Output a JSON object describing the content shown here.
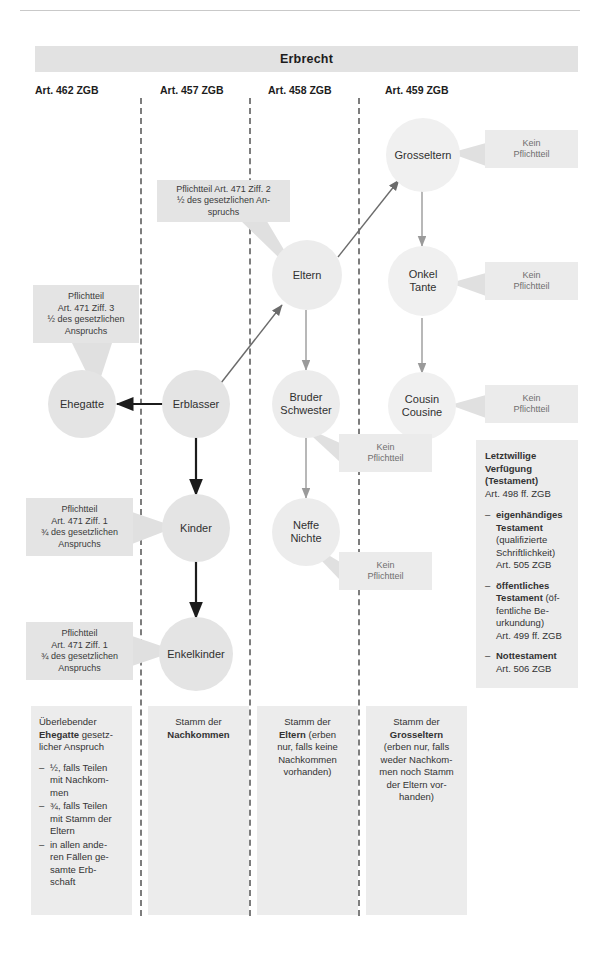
{
  "header": {
    "title": "Erbrecht"
  },
  "columns": [
    {
      "id": "col-462",
      "label": "Art. 462 ZGB"
    },
    {
      "id": "col-457",
      "label": "Art. 457 ZGB"
    },
    {
      "id": "col-458",
      "label": "Art. 458 ZGB"
    },
    {
      "id": "col-459",
      "label": "Art. 459 ZGB"
    }
  ],
  "nodes": {
    "grosseltern": "Grosseltern",
    "eltern": "Eltern",
    "onkel_tante": "Onkel\nTante",
    "onkel_tante_l1": "Onkel",
    "onkel_tante_l2": "Tante",
    "ehegatte": "Ehegatte",
    "erblasser": "Erblasser",
    "bruder_schwester_l1": "Bruder",
    "bruder_schwester_l2": "Schwester",
    "cousin_cousine_l1": "Cousin",
    "cousin_cousine_l2": "Cousine",
    "kinder": "Kinder",
    "neffe_nichte_l1": "Neffe",
    "neffe_nichte_l2": "Nichte",
    "enkelkinder": "Enkelkinder"
  },
  "callouts": {
    "eltern_pflichtteil": "Pflichtteil Art. 471 Ziff. 2\n½ des gesetzlichen An-\nspruchs",
    "eltern_pflichtteil_l1": "Pflichtteil Art. 471 Ziff. 2",
    "eltern_pflichtteil_l2": "½ des gesetzlichen An-",
    "eltern_pflichtteil_l3": "spruchs",
    "ehegatte_pflichtteil_l1": "Pflichtteil",
    "ehegatte_pflichtteil_l2": "Art. 471 Ziff. 3",
    "ehegatte_pflichtteil_l3": "½ des gesetzlichen",
    "ehegatte_pflichtteil_l4": "Anspruchs",
    "kinder_pflichtteil_l1": "Pflichtteil",
    "kinder_pflichtteil_l2": "Art. 471 Ziff. 1",
    "kinder_pflichtteil_l3": "¾ des gesetzlichen",
    "kinder_pflichtteil_l4": "Anspruchs",
    "enkel_pflichtteil_l1": "Pflichtteil",
    "enkel_pflichtteil_l2": "Art. 471 Ziff. 1",
    "enkel_pflichtteil_l3": "¾ des gesetzlichen",
    "enkel_pflichtteil_l4": "Anspruchs",
    "kein_pflichtteil_l1": "Kein",
    "kein_pflichtteil_l2": "Pflichtteil"
  },
  "legend": {
    "col1": {
      "lead_1": "Überlebender ",
      "lead_b": "Ehegatte",
      "lead_2": " gesetz-",
      "lead_3": "licher Anspruch",
      "items": [
        "½, falls Teilen mit Nachkom-men",
        "¾, falls Teilen mit Stamm der Eltern",
        "in allen ande-ren Fällen ge-samte Erb-schaft"
      ],
      "item1_l1": "½, falls Teilen",
      "item1_l2": "mit Nachkom-",
      "item1_l3": "men",
      "item2_l1": "¾, falls Teilen",
      "item2_l2": "mit Stamm der",
      "item2_l3": "Eltern",
      "item3_l1": "in allen ande-",
      "item3_l2": "ren Fällen ge-",
      "item3_l3": "samte Erb-",
      "item3_l4": "schaft"
    },
    "col2": {
      "line1": "Stamm der",
      "bold": "Nachkommen"
    },
    "col3": {
      "line1": "Stamm der",
      "bold": "Eltern",
      "rest_l1": " (erben",
      "rest_l2": "nur, falls keine",
      "rest_l3": "Nachkommen",
      "rest_l4": "vorhanden)"
    },
    "col4": {
      "line1": "Stamm der",
      "bold": "Grosseltern",
      "rest_l1": "(erben nur, falls",
      "rest_l2": "weder Nachkom-",
      "rest_l3": "men noch Stamm",
      "rest_l4": "der Eltern vor-",
      "rest_l5": "handen)"
    }
  },
  "panel": {
    "title_l1": "Letztwillige",
    "title_l2": "Verfügung",
    "title_l3": "(Testament)",
    "sub": "Art. 498 ff. ZGB",
    "items": [
      {
        "b1": "eigenhändiges",
        "b2": "Testament",
        "t1": "(qualifizierte",
        "t2": "Schriftlichkeit)",
        "t3": "Art. 505 ZGB"
      },
      {
        "b1": "öffentliches",
        "b2": "Testament",
        "t0": " (öf-",
        "t1": "fentliche Be-",
        "t2": "urkundung)",
        "t3": "Art. 499 ff. ZGB"
      },
      {
        "b1": "Nottestament",
        "t1": "Art. 506 ZGB"
      }
    ]
  },
  "colors": {
    "header_bg": "#e2e2e2",
    "node_bg": "#e4e4e4",
    "chip_bg": "#e4e4e4",
    "legend_bg": "#ececec",
    "dash": "#7d7d7d",
    "arrow_dark": "#1c1c1c",
    "arrow_light": "#9a9a9a"
  }
}
